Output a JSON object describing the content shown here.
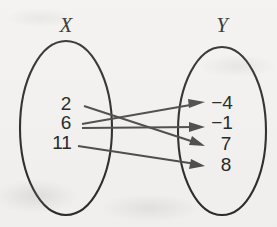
{
  "diagram": {
    "type": "mapping-diagram",
    "title": "",
    "domain_set": {
      "label": "X",
      "elements": [
        {
          "value": "2",
          "x": 66,
          "y": 110
        },
        {
          "value": "6",
          "x": 66,
          "y": 129
        },
        {
          "value": "11",
          "x": 58,
          "y": 149
        }
      ],
      "ellipse": {
        "cx": 66,
        "cy": 128,
        "rx": 46,
        "ry": 87
      }
    },
    "codomain_set": {
      "label": "Y",
      "elements": [
        {
          "value": "−4",
          "x": 215,
          "y": 109
        },
        {
          "value": "−1",
          "x": 215,
          "y": 129
        },
        {
          "value": "7",
          "x": 222,
          "y": 149
        },
        {
          "value": "8",
          "x": 222,
          "y": 170
        }
      ],
      "ellipse": {
        "cx": 222,
        "cy": 131,
        "rx": 44,
        "ry": 84
      }
    },
    "arrows": [
      {
        "from": "2",
        "to": "7",
        "x1": 84,
        "y1": 106,
        "x2": 203,
        "y2": 145
      },
      {
        "from": "6",
        "to": "−4",
        "x1": 82,
        "y1": 124,
        "x2": 203,
        "y2": 103
      },
      {
        "from": "6",
        "to": "−1",
        "x1": 82,
        "y1": 128,
        "x2": 203,
        "y2": 127
      },
      {
        "from": "11",
        "to": "8",
        "x1": 78,
        "y1": 146,
        "x2": 203,
        "y2": 166
      }
    ],
    "colors": {
      "background": "#f3f2f0",
      "ellipse_stroke": "#2b2b2b",
      "arrow": "#4a4a4a",
      "text": "#222222"
    }
  }
}
